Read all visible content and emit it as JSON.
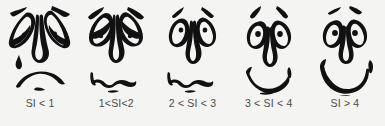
{
  "figure": {
    "type": "rating-scale-illustration",
    "background_color": "#f4f4f2",
    "ink_color": "#111111",
    "label_color": "#4b4b4b",
    "orientation": "horizontal",
    "item_count": 5,
    "scale_name": "SI"
  },
  "faces": [
    {
      "label": "SI < 1",
      "expression": "very-sad-crying",
      "eyes": "drooping-leaf-eyes-with-heavy-lids",
      "eyebrows": "steeply-slanted-down",
      "mouth": "deep-frown-arc",
      "extra": "teardrop-on-left-cheek",
      "icon": "sad-face-icon"
    },
    {
      "label": "1<SI<2",
      "expression": "sad",
      "eyes": "droopy-half-closed-eyes-with-pupils",
      "eyebrows": "slanted-down",
      "mouth": "wavy-downturned-squiggle",
      "extra": "chin-mark",
      "icon": "slightly-sad-face-icon"
    },
    {
      "label": "2 < SI < 3",
      "expression": "neutral",
      "eyes": "open-oval-eyes-with-small-pupils",
      "eyebrows": "short-raised-strokes",
      "mouth": "flat-wavy-squiggle",
      "extra": "chin-mark",
      "icon": "neutral-face-icon"
    },
    {
      "label": "3 < SI < 4",
      "expression": "happy",
      "eyes": "round-eyes-with-dot-pupils",
      "eyebrows": "arched-raised",
      "mouth": "crescent-smile-with-upturned-tips",
      "extra": "chin-mark",
      "icon": "smiling-face-icon"
    },
    {
      "label": "SI > 4",
      "expression": "very-happy",
      "eyes": "round-wide-eyes-with-dot-pupils",
      "eyebrows": "high-raised-dashes",
      "mouth": "wide-open-grin",
      "extra": "chin-mark",
      "icon": "grinning-face-icon"
    }
  ]
}
